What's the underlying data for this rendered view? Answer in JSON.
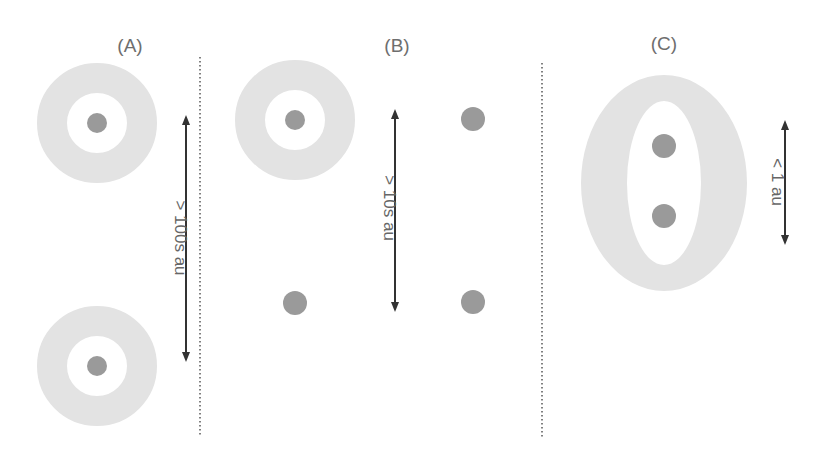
{
  "colors": {
    "background": "#ffffff",
    "disk": "#e3e3e3",
    "star": "#9a9a9a",
    "arrow": "#333333",
    "divider": "#555555",
    "text": "#6e6e6e"
  },
  "panels": [
    {
      "id": "A",
      "label": "(A)",
      "distance_label": "> 100s au",
      "description": "Wide binary: two stars each with its own circumstellar disk"
    },
    {
      "id": "B",
      "label": "(B)",
      "distance_label": "> 10s au",
      "description": "Intermediate separation: one star retains a disk, others are bare"
    },
    {
      "id": "C",
      "label": "(C)",
      "distance_label": "< 1 au",
      "description": "Close binary surrounded by a circumbinary disk"
    }
  ]
}
